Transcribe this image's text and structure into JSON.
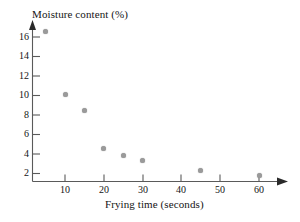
{
  "chart_data": {
    "type": "scatter",
    "title": "",
    "xlabel": "Frying time (seconds)",
    "ylabel": "Moisture content (%)",
    "x": [
      5,
      10,
      15,
      20,
      25,
      30,
      45,
      60
    ],
    "values": [
      16.6,
      10.1,
      8.5,
      4.6,
      3.8,
      3.3,
      2.3,
      1.8
    ],
    "points": [
      {
        "x": 5,
        "y": 16.6
      },
      {
        "x": 10,
        "y": 10.1
      },
      {
        "x": 15,
        "y": 8.5
      },
      {
        "x": 20,
        "y": 4.6
      },
      {
        "x": 25,
        "y": 3.8
      },
      {
        "x": 30,
        "y": 3.3
      },
      {
        "x": 45,
        "y": 2.3
      },
      {
        "x": 60,
        "y": 1.8
      }
    ],
    "xticks": [
      10,
      20,
      30,
      40,
      50,
      60
    ],
    "yticks": [
      2,
      4,
      6,
      8,
      10,
      12,
      14,
      16
    ],
    "xlim": [
      0,
      70
    ],
    "ylim": [
      0,
      17.5
    ],
    "grid": false,
    "legend": "none",
    "marker_color": "#9a9a9a",
    "axis_color": "#5a5a5a"
  },
  "axes": {
    "y_title": "Moisture content (%)",
    "x_title": "Frying time (seconds)"
  },
  "ticks": {
    "x": [
      "10",
      "20",
      "30",
      "40",
      "50",
      "60"
    ],
    "y": [
      "2",
      "4",
      "6",
      "8",
      "10",
      "12",
      "14",
      "16"
    ]
  }
}
